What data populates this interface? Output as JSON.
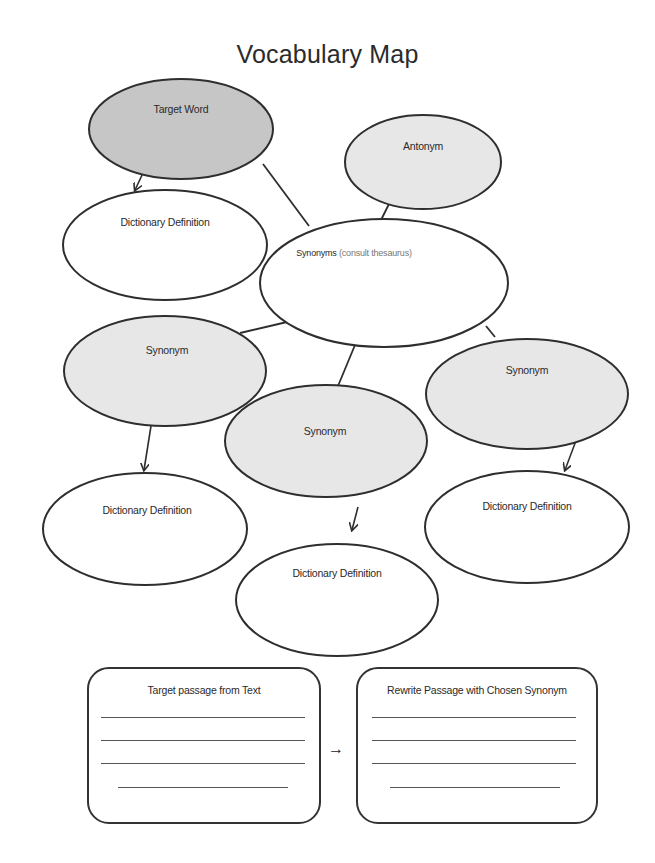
{
  "title": "Vocabulary Map",
  "colors": {
    "stroke": "#2e2e2e",
    "target_fill": "#c6c6c6",
    "shaded_fill": "#e7e7e7",
    "blank_fill": "#ffffff"
  },
  "nodes": {
    "target_word": {
      "label": "Target Word"
    },
    "definition_top": {
      "label": "Dictionary Definition"
    },
    "antonym": {
      "label": "Antonym"
    },
    "synonyms_hub": {
      "label": "Synonyms",
      "note": "(consult thesaurus)"
    },
    "synonym_left": {
      "label": "Synonym"
    },
    "synonym_center": {
      "label": "Synonym"
    },
    "synonym_right": {
      "label": "Synonym"
    },
    "definition_left": {
      "label": "Dictionary Definition"
    },
    "definition_center": {
      "label": "Dictionary Definition"
    },
    "definition_right": {
      "label": "Dictionary Definition"
    }
  },
  "passage_boxes": {
    "source": {
      "title": "Target passage from Text",
      "line_count": 4
    },
    "rewrite": {
      "title": "Rewrite Passage with Chosen Synonym",
      "line_count": 4
    },
    "arrow": "→"
  }
}
